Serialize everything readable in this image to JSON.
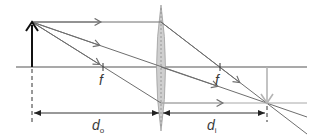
{
  "diagram": {
    "type": "thin-lens-ray-diagram",
    "lens": {
      "kind": "converging",
      "x": 161,
      "top": 5,
      "bottom": 131
    },
    "optical_axis": {
      "y": 67,
      "x_start": 16,
      "x_end": 307
    },
    "object": {
      "x": 32,
      "tip_y": 22,
      "base_y": 67,
      "label": "object"
    },
    "image": {
      "x": 267,
      "tip_y": 103,
      "base_y": 67,
      "label": "image"
    },
    "focal_points": [
      {
        "label": "f",
        "x": 103
      },
      {
        "label": "f",
        "x": 220
      }
    ],
    "dimensions": [
      {
        "symbol": "d",
        "subscript": "o",
        "from_x": 32,
        "to_x": 161
      },
      {
        "symbol": "d",
        "subscript": "i",
        "from_x": 161,
        "to_x": 267
      }
    ],
    "colors": {
      "ray": "#6e6e6e",
      "axis": "#555555",
      "object_arrow": "#111111",
      "image_arrow": "#b4b4b4",
      "lens_fill": "#c8c8c8",
      "lens_stroke": "#9a9a9a",
      "dimension": "#333333"
    }
  },
  "labels": {
    "focal_left": "f",
    "focal_right": "f",
    "do_main": "d",
    "do_sub": "o",
    "di_main": "d",
    "di_sub": "i"
  }
}
